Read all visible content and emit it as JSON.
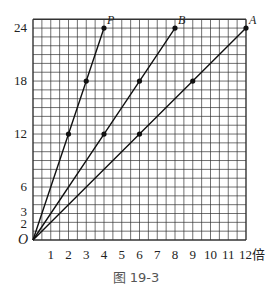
{
  "chart_data": {
    "type": "line",
    "title": "",
    "caption": "图 19-3",
    "xlabel": "倍",
    "ylabel": "",
    "origin_label": "O",
    "xlim": [
      0,
      12
    ],
    "ylim": [
      0,
      25
    ],
    "x_ticks": [
      1,
      2,
      3,
      4,
      5,
      6,
      7,
      8,
      9,
      10,
      11,
      12
    ],
    "x_tick_labels": [
      "1",
      "2",
      "3",
      "4",
      "5",
      "6",
      "7",
      "8",
      "9",
      "10",
      "11",
      "12倍"
    ],
    "y_ticks": [
      2,
      3,
      6,
      12,
      18,
      24
    ],
    "y_tick_labels": [
      "2",
      "3",
      "6",
      "12",
      "18",
      "24"
    ],
    "grid": true,
    "series": [
      {
        "name": "P",
        "x": [
          0,
          2,
          3,
          4
        ],
        "y": [
          0,
          12,
          18,
          24
        ],
        "markers": [
          [
            2,
            12
          ],
          [
            3,
            18
          ],
          [
            4,
            24
          ]
        ]
      },
      {
        "name": "B",
        "x": [
          0,
          4,
          6,
          8
        ],
        "y": [
          0,
          12,
          18,
          24
        ],
        "markers": [
          [
            4,
            12
          ],
          [
            6,
            18
          ],
          [
            8,
            24
          ]
        ]
      },
      {
        "name": "A",
        "x": [
          0,
          6,
          9,
          12
        ],
        "y": [
          0,
          12,
          18,
          24
        ],
        "markers": [
          [
            6,
            12
          ],
          [
            9,
            18
          ],
          [
            12,
            24
          ]
        ]
      }
    ]
  }
}
